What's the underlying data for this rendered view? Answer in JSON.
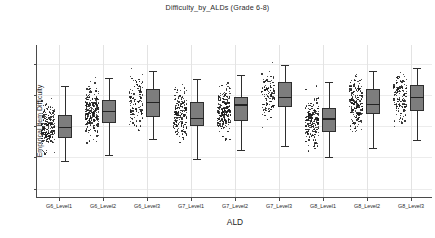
{
  "chart_data": {
    "type": "box",
    "title": "Difficulty_by_ALDs (Grade 6-8)",
    "xlabel": "ALD",
    "ylabel": "Empirical Item Difficulty",
    "ylim": [
      -4.6,
      5.2
    ],
    "yticks": [
      4,
      2,
      0,
      -2,
      -4
    ],
    "ytick_labels": [
      "4",
      "2",
      "0",
      "-2",
      "-4"
    ],
    "grid": "both-light",
    "legend": "none",
    "overlay": "jittered strip of individual item points left of each box",
    "categories": [
      "G6_Level1",
      "G6_Level2",
      "G6_Level3",
      "G7_Level1",
      "G7_Level2",
      "G7_Level3",
      "G8_Level1",
      "G8_Level2",
      "G8_Level3"
    ],
    "boxes": [
      {
        "category": "G6_Level1",
        "whisker_low": -2.25,
        "q1": -0.75,
        "median": -0.05,
        "q3": 0.7,
        "whisker_high": 2.6,
        "n_points": 210
      },
      {
        "category": "G6_Level2",
        "whisker_low": -1.85,
        "q1": 0.2,
        "median": 1.0,
        "q3": 1.7,
        "whisker_high": 3.1,
        "n_points": 230
      },
      {
        "category": "G6_Level3",
        "whisker_low": -0.8,
        "q1": 0.6,
        "median": 1.55,
        "q3": 2.35,
        "whisker_high": 3.55,
        "n_points": 120
      },
      {
        "category": "G7_Level1",
        "whisker_low": -2.1,
        "q1": 0.0,
        "median": 0.55,
        "q3": 1.55,
        "whisker_high": 3.05,
        "n_points": 185
      },
      {
        "category": "G7_Level2",
        "whisker_low": -1.55,
        "q1": 0.35,
        "median": 1.4,
        "q3": 1.85,
        "whisker_high": 3.25,
        "n_points": 215
      },
      {
        "category": "G7_Level3",
        "whisker_low": -1.3,
        "q1": 1.25,
        "median": 1.85,
        "q3": 2.85,
        "whisker_high": 3.95,
        "n_points": 115
      },
      {
        "category": "G8_Level1",
        "whisker_low": -1.95,
        "q1": -0.35,
        "median": 0.5,
        "q3": 1.15,
        "whisker_high": 2.8,
        "n_points": 175
      },
      {
        "category": "G8_Level2",
        "whisker_low": -1.4,
        "q1": 0.75,
        "median": 1.45,
        "q3": 2.4,
        "whisker_high": 3.55,
        "n_points": 190
      },
      {
        "category": "G8_Level3",
        "whisker_low": -0.9,
        "q1": 1.0,
        "median": 1.85,
        "q3": 2.65,
        "whisker_high": 3.7,
        "n_points": 130
      }
    ],
    "colors": {
      "box_fill": "#7d7d7d",
      "box_edge": "#2e2e2e",
      "median": "#232323",
      "point": "#1a1a1a",
      "grid": "#e3e3e3",
      "axis": "#4a4a4a",
      "background": "#ffffff"
    }
  },
  "caption": ""
}
